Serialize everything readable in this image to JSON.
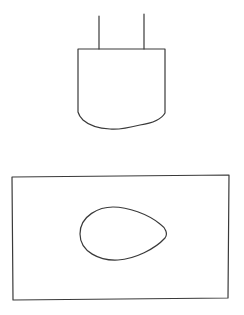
{
  "diagram": {
    "background": "#ffffff",
    "stroke_color": "#3a3a3a",
    "shapes": [
      {
        "name": "electrode-left-lead",
        "type": "line"
      },
      {
        "name": "electrode-right-lead",
        "type": "line"
      },
      {
        "name": "container-vessel",
        "type": "u-shaped-vessel"
      },
      {
        "name": "rectangle-frame",
        "type": "rectangle"
      },
      {
        "name": "teardrop-shape",
        "type": "teardrop"
      }
    ]
  }
}
